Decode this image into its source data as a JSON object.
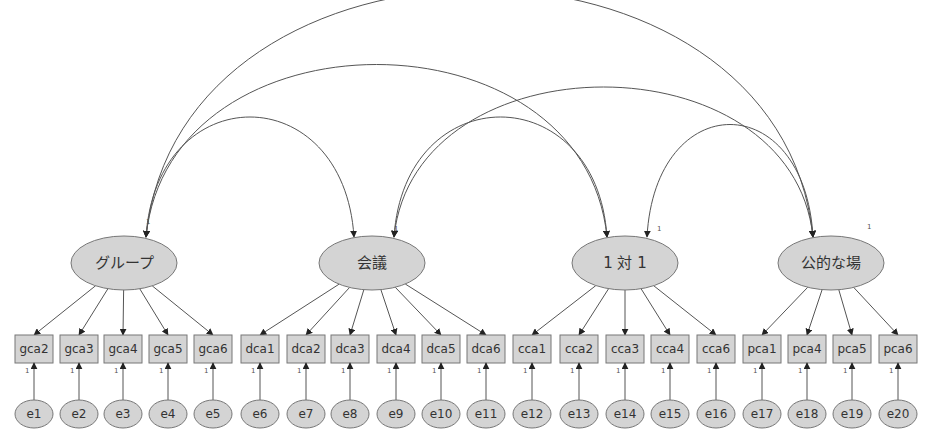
{
  "diagram": {
    "type": "structural-equation-model-path-diagram",
    "colors": {
      "node_fill": "#d4d4d4",
      "node_stroke": "#777777",
      "line": "#555555",
      "arrowhead": "#222222",
      "text": "#333333"
    },
    "latent_factors": [
      {
        "id": "group",
        "label": "グループ",
        "cx": 124,
        "cy": 263,
        "fixed_label": "1",
        "fixed_x": 146,
        "fixed_y": 224
      },
      {
        "id": "meeting",
        "label": "会議",
        "cx": 372,
        "cy": 263,
        "fixed_label": "1",
        "fixed_x": 394,
        "fixed_y": 231
      },
      {
        "id": "one-on-one",
        "label": "1 対 1",
        "cx": 625,
        "cy": 263,
        "fixed_label": "1",
        "fixed_x": 657,
        "fixed_y": 231
      },
      {
        "id": "public",
        "label": "公的な場",
        "cx": 831,
        "cy": 263,
        "fixed_label": "1",
        "fixed_x": 867,
        "fixed_y": 229
      }
    ],
    "indicators": [
      {
        "label": "gca2",
        "factor": "group",
        "x": 34
      },
      {
        "label": "gca3",
        "factor": "group",
        "x": 79
      },
      {
        "label": "gca4",
        "factor": "group",
        "x": 123
      },
      {
        "label": "gca5",
        "factor": "group",
        "x": 168
      },
      {
        "label": "gca6",
        "factor": "group",
        "x": 213
      },
      {
        "label": "dca1",
        "factor": "meeting",
        "x": 260
      },
      {
        "label": "dca2",
        "factor": "meeting",
        "x": 306
      },
      {
        "label": "dca3",
        "factor": "meeting",
        "x": 350
      },
      {
        "label": "dca4",
        "factor": "meeting",
        "x": 396
      },
      {
        "label": "dca5",
        "factor": "meeting",
        "x": 441
      },
      {
        "label": "dca6",
        "factor": "meeting",
        "x": 486
      },
      {
        "label": "cca1",
        "factor": "one-on-one",
        "x": 532
      },
      {
        "label": "cca2",
        "factor": "one-on-one",
        "x": 579
      },
      {
        "label": "cca3",
        "factor": "one-on-one",
        "x": 625
      },
      {
        "label": "cca4",
        "factor": "one-on-one",
        "x": 670
      },
      {
        "label": "cca6",
        "factor": "one-on-one",
        "x": 716
      },
      {
        "label": "pca1",
        "factor": "public",
        "x": 762
      },
      {
        "label": "pca4",
        "factor": "public",
        "x": 807
      },
      {
        "label": "pca5",
        "factor": "public",
        "x": 852
      },
      {
        "label": "pca6",
        "factor": "public",
        "x": 898
      }
    ],
    "errors": [
      "e1",
      "e2",
      "e3",
      "e4",
      "e5",
      "e6",
      "e7",
      "e8",
      "e9",
      "e10",
      "e11",
      "e12",
      "e13",
      "e14",
      "e15",
      "e16",
      "e17",
      "e18",
      "e19",
      "e20"
    ],
    "error_path_label": "1",
    "covariances": [
      {
        "from": "group",
        "to": "meeting"
      },
      {
        "from": "group",
        "to": "one-on-one"
      },
      {
        "from": "group",
        "to": "public"
      },
      {
        "from": "meeting",
        "to": "one-on-one"
      },
      {
        "from": "meeting",
        "to": "public"
      },
      {
        "from": "one-on-one",
        "to": "public"
      }
    ]
  }
}
